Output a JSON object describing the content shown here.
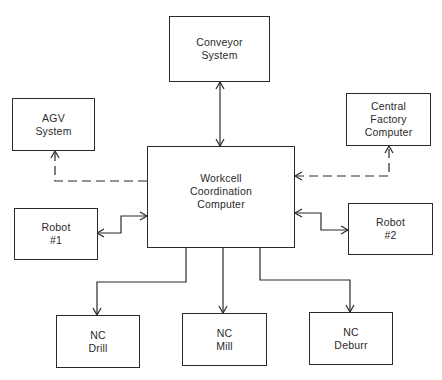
{
  "diagram": {
    "type": "block-diagram",
    "nodes": {
      "conveyor": {
        "line1": "Conveyor",
        "line2": "System"
      },
      "agv": {
        "line1": "AGV",
        "line2": "System"
      },
      "central": {
        "line1": "Central",
        "line2": "Factory",
        "line3": "Computer"
      },
      "workcell": {
        "line1": "Workcell",
        "line2": "Coordination",
        "line3": "Computer"
      },
      "robot1": {
        "line1": "Robot",
        "line2": "#1"
      },
      "robot2": {
        "line1": "Robot",
        "line2": "#2"
      },
      "drill": {
        "line1": "NC",
        "line2": "Drill"
      },
      "mill": {
        "line1": "NC",
        "line2": "Mill"
      },
      "deburr": {
        "line1": "NC",
        "line2": "Deburr"
      }
    },
    "edges": [
      {
        "from": "workcell",
        "to": "conveyor",
        "style": "solid",
        "direction": "bidirectional"
      },
      {
        "from": "workcell",
        "to": "agv",
        "style": "dashed",
        "direction": "to-agv"
      },
      {
        "from": "central",
        "to": "workcell",
        "style": "dashed",
        "direction": "bidirectional"
      },
      {
        "from": "workcell",
        "to": "robot1",
        "style": "solid",
        "direction": "bidirectional"
      },
      {
        "from": "workcell",
        "to": "robot2",
        "style": "solid",
        "direction": "bidirectional"
      },
      {
        "from": "workcell",
        "to": "drill",
        "style": "solid",
        "direction": "to-drill"
      },
      {
        "from": "workcell",
        "to": "mill",
        "style": "solid",
        "direction": "to-mill"
      },
      {
        "from": "workcell",
        "to": "deburr",
        "style": "solid",
        "direction": "to-deburr"
      }
    ]
  }
}
